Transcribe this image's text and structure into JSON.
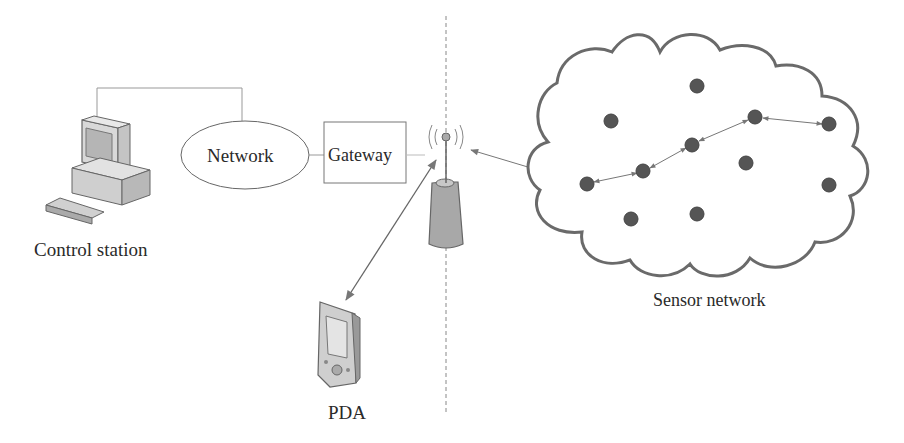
{
  "diagram": {
    "type": "network-architecture",
    "nodes": {
      "control_station": {
        "label": "Control station",
        "icon": "desktop-computer-icon"
      },
      "network": {
        "label": "Network",
        "shape": "ellipse"
      },
      "gateway": {
        "label": "Gateway",
        "shape": "rectangle"
      },
      "base_station": {
        "icon": "antenna-tower-icon"
      },
      "pda": {
        "label": "PDA",
        "icon": "pda-icon"
      },
      "sensor_network": {
        "label": "Sensor network",
        "shape": "cloud",
        "sensor_count": 11
      }
    },
    "edges": [
      {
        "from": "control_station",
        "to": "network",
        "style": "thin-line"
      },
      {
        "from": "network",
        "to": "gateway",
        "style": "thin-line"
      },
      {
        "from": "gateway",
        "to": "base_station",
        "style": "thin-line"
      },
      {
        "from": "pda",
        "to": "base_station",
        "style": "bidirectional-arrow"
      },
      {
        "from": "base_station",
        "to": "sensor_network",
        "style": "bidirectional-arrow"
      }
    ],
    "divider": {
      "style": "dashed-vertical"
    },
    "colors": {
      "line": "#777777",
      "text": "#2a2a2a",
      "cloud_stroke": "#6a6a6a",
      "sensor_fill": "#555555",
      "tower_fill": "#a8a8a8"
    }
  }
}
